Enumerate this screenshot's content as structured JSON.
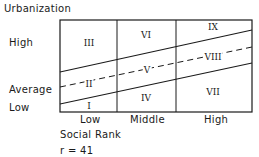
{
  "title": "Urbanization",
  "y_axis": {
    "label": "Urbanization",
    "levels": [
      "High",
      "Average",
      "Low"
    ]
  },
  "x_axis": {
    "label": "Social Rank",
    "categories": [
      "Low",
      "Middle",
      "High"
    ]
  },
  "correlation": "r = 41",
  "cells": [
    {
      "id": "I",
      "label": "I",
      "social_rank": "Low",
      "urbanization": "Low"
    },
    {
      "id": "II",
      "label": "II",
      "social_rank": "Low",
      "urbanization": "Average"
    },
    {
      "id": "III",
      "label": "III",
      "social_rank": "Low",
      "urbanization": "High"
    },
    {
      "id": "IV",
      "label": "IV",
      "social_rank": "Middle",
      "urbanization": "Low"
    },
    {
      "id": "V",
      "label": "V",
      "social_rank": "Middle",
      "urbanization": "Average"
    },
    {
      "id": "VI",
      "label": "VI",
      "social_rank": "Middle",
      "urbanization": "High"
    },
    {
      "id": "VII",
      "label": "VII",
      "social_rank": "High",
      "urbanization": "Low"
    },
    {
      "id": "VIII",
      "label": "VIII",
      "social_rank": "High",
      "urbanization": "Average"
    },
    {
      "id": "IX",
      "label": "IX",
      "social_rank": "High",
      "urbanization": "High"
    }
  ],
  "lines": {
    "upper": "solid",
    "middle": "dashed",
    "lower": "solid"
  },
  "colors": {
    "ink": "#1a1a1a",
    "background": "#ffffff"
  }
}
